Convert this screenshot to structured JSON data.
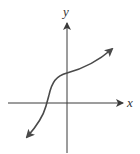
{
  "diagram": {
    "type": "function-graph",
    "axes": {
      "x_label": "x",
      "y_label": "y"
    },
    "colors": {
      "axis": "#3a3a3a",
      "curve": "#4a4a4a",
      "background": "#ffffff"
    }
  }
}
